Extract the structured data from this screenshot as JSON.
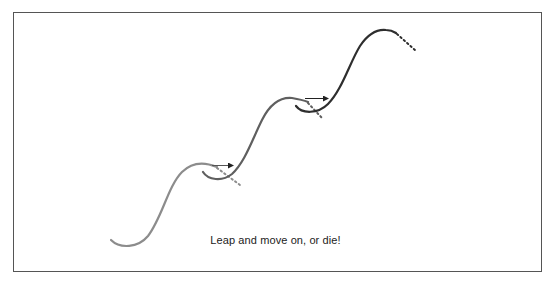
{
  "diagram": {
    "caption": "Leap and move on, or die!",
    "curves": [
      {
        "name": "curve-1",
        "color": "#8c8c8c"
      },
      {
        "name": "curve-2",
        "color": "#5f5f5f"
      },
      {
        "name": "curve-3",
        "color": "#2e2e2e"
      }
    ],
    "arrows": [
      {
        "name": "leap-arrow-1",
        "from": "curve-1",
        "to": "curve-2"
      },
      {
        "name": "leap-arrow-2",
        "from": "curve-2",
        "to": "curve-3"
      }
    ],
    "colors": {
      "border": "#555555",
      "arrow": "#222222"
    }
  }
}
